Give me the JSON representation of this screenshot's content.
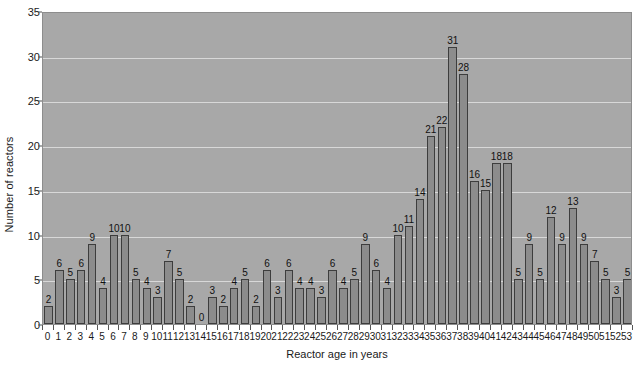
{
  "chart_data": {
    "type": "bar",
    "title": "",
    "xlabel": "Reactor age in years",
    "ylabel": "Number of reactors",
    "categories": [
      "0",
      "1",
      "2",
      "3",
      "4",
      "5",
      "6",
      "7",
      "8",
      "9",
      "10",
      "11",
      "12",
      "13",
      "14",
      "15",
      "16",
      "17",
      "18",
      "19",
      "20",
      "21",
      "22",
      "23",
      "24",
      "25",
      "26",
      "27",
      "28",
      "29",
      "30",
      "31",
      "32",
      "33",
      "34",
      "35",
      "36",
      "37",
      "38",
      "39",
      "40",
      "41",
      "42",
      "43",
      "44",
      "45",
      "46",
      "47",
      "48",
      "49",
      "50",
      "51",
      "52",
      "53"
    ],
    "values": [
      2,
      6,
      5,
      6,
      9,
      4,
      10,
      10,
      5,
      4,
      3,
      7,
      5,
      2,
      0,
      3,
      2,
      4,
      5,
      2,
      6,
      3,
      6,
      4,
      4,
      3,
      6,
      4,
      5,
      9,
      6,
      4,
      10,
      11,
      14,
      21,
      22,
      31,
      28,
      16,
      15,
      18,
      18,
      5,
      9,
      5,
      12,
      9,
      13,
      9,
      7,
      5,
      3,
      5
    ],
    "ylim": [
      0,
      35
    ],
    "yticks": [
      0,
      5,
      10,
      15,
      20,
      25,
      30,
      35
    ],
    "grid": true,
    "legend": false,
    "show_value_labels": true,
    "colors": {
      "plot_background": "#a8a8a8",
      "bar_fill": "#8c8c8c",
      "bar_border": "#3d3d3d",
      "gridline": "#d8d8d8",
      "axis_text": "#1a1a1a",
      "page_background": "#ffffff"
    }
  }
}
